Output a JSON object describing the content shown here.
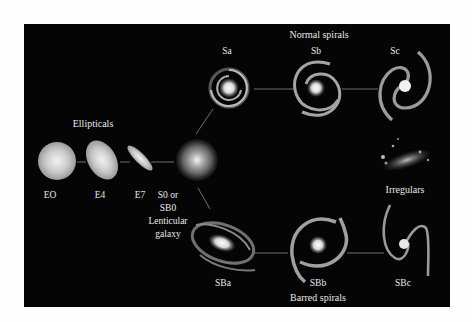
{
  "groups": {
    "ellipticals": "Ellipticals",
    "normal_spirals": "Normal spirals",
    "barred_spirals": "Barred spirals",
    "irregulars": "Irregulars"
  },
  "ellipticals": [
    {
      "label": "EO"
    },
    {
      "label": "E4"
    },
    {
      "label": "E7"
    }
  ],
  "lenticular": {
    "line1": "S0 or",
    "line2": "SB0",
    "line3": "Lenticular",
    "line4": "galaxy"
  },
  "normal_spirals": [
    {
      "label": "Sa"
    },
    {
      "label": "Sb"
    },
    {
      "label": "Sc"
    }
  ],
  "barred_spirals": [
    {
      "label": "SBa"
    },
    {
      "label": "SBb"
    },
    {
      "label": "SBc"
    }
  ],
  "colors": {
    "background": "#050505",
    "text": "#e8e8e8",
    "connector": "#8a8a8a",
    "page": "#fdfdfd"
  }
}
